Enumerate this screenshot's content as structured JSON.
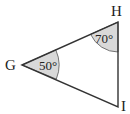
{
  "diagram": {
    "type": "triangle",
    "vertices": {
      "G": {
        "label": "G",
        "x": 22,
        "y": 65
      },
      "H": {
        "label": "H",
        "x": 118,
        "y": 22
      },
      "I": {
        "label": "I",
        "x": 118,
        "y": 107
      }
    },
    "angles": {
      "G": {
        "value": "50°"
      },
      "H": {
        "value": "70°"
      }
    },
    "colors": {
      "stroke": "#333333",
      "angle_fill": "#d9d9d9"
    }
  }
}
